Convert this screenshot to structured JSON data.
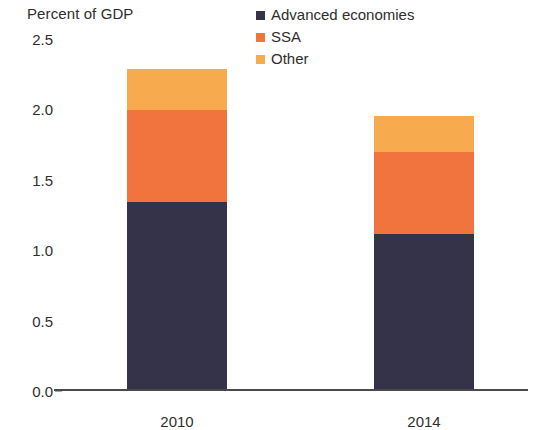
{
  "chart_data": {
    "type": "bar",
    "subtype": "stacked-vertical",
    "title": "",
    "ylabel": "Percent of GDP",
    "xlabel": "",
    "categories": [
      "2010",
      "2014"
    ],
    "series": [
      {
        "name": "Advanced economies",
        "color": "#343349",
        "values": [
          1.33,
          1.1
        ]
      },
      {
        "name": "SSA",
        "color": "#F1743F",
        "values": [
          0.65,
          0.58
        ]
      },
      {
        "name": "Other",
        "color": "#F7AB4E",
        "values": [
          0.29,
          0.26
        ]
      }
    ],
    "totals": [
      2.27,
      1.94
    ],
    "ylim": [
      0.0,
      2.5
    ],
    "yticks": [
      "0.0",
      "0.5",
      "1.0",
      "1.5",
      "2.0",
      "2.5"
    ],
    "ytick_values": [
      0.0,
      0.5,
      1.0,
      1.5,
      2.0,
      2.5
    ],
    "grid": false,
    "legend_position": "top-right"
  },
  "axis": {
    "y_title": "Percent of GDP"
  },
  "legend": {
    "items": [
      {
        "label": "Advanced economies",
        "color": "#343349"
      },
      {
        "label": "SSA",
        "color": "#F1743F"
      },
      {
        "label": "Other",
        "color": "#F7AB4E"
      }
    ]
  }
}
